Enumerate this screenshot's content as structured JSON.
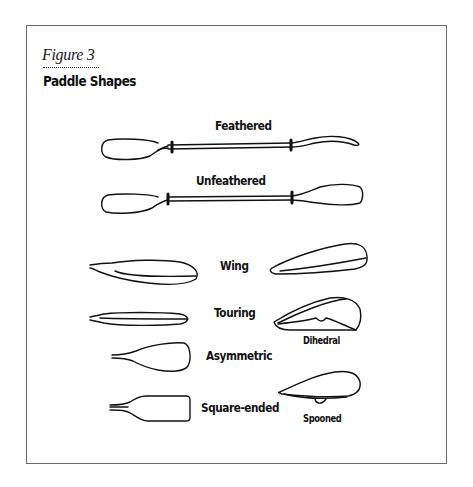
{
  "figure": {
    "label": "Figure 3",
    "title": "Paddle Shapes"
  },
  "paddles": [
    {
      "name": "Feathered",
      "type": "full-paddle"
    },
    {
      "name": "Unfeathered",
      "type": "full-paddle"
    }
  ],
  "blades": [
    {
      "name": "Wing",
      "column": "left"
    },
    {
      "name": "Touring",
      "column": "left"
    },
    {
      "name": "Asymmetric",
      "column": "left"
    },
    {
      "name": "Square-ended",
      "column": "left"
    }
  ],
  "blade_profiles": [
    {
      "name": "Dihedral",
      "column": "right"
    },
    {
      "name": "Spooned",
      "column": "right"
    }
  ]
}
